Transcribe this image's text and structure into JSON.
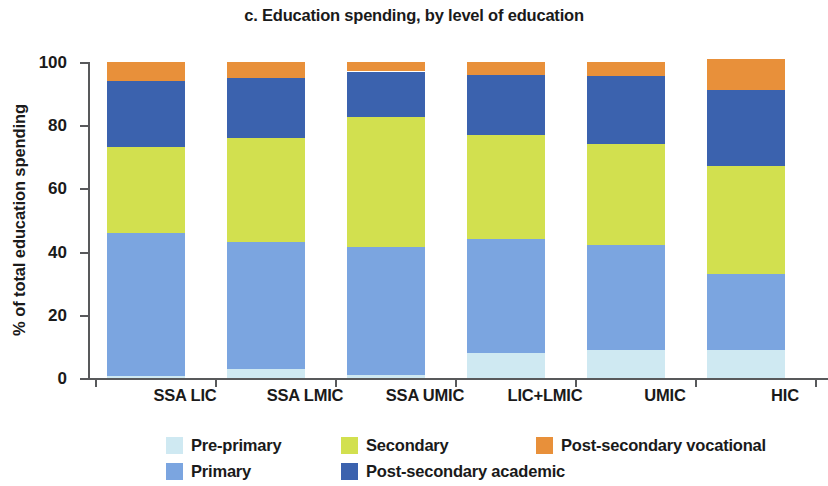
{
  "chart_data": {
    "type": "bar",
    "subtype": "stacked-100",
    "title": "c. Education spending, by level of education",
    "xlabel": "",
    "ylabel": "% of total education spending",
    "ylim": [
      0,
      100
    ],
    "yticks": [
      0,
      20,
      40,
      60,
      80,
      100
    ],
    "grid": false,
    "legend_position": "bottom",
    "categories": [
      "SSA LIC",
      "SSA LMIC",
      "SSA UMIC",
      "LIC+LMIC",
      "UMIC",
      "HIC"
    ],
    "series": [
      {
        "name": "Pre-primary",
        "color": "#cfe9f2",
        "values": [
          0.5,
          3.0,
          1.0,
          8.0,
          9.0,
          9.0
        ]
      },
      {
        "name": "Primary",
        "color": "#7ba5e0",
        "values": [
          45.5,
          40.0,
          40.5,
          36.0,
          33.0,
          24.0
        ]
      },
      {
        "name": "Secondary",
        "color": "#d2e04f",
        "values": [
          27.0,
          33.0,
          41.0,
          33.0,
          32.0,
          34.0
        ]
      },
      {
        "name": "Post-secondary academic",
        "color": "#3b62ae",
        "values": [
          21.0,
          19.0,
          14.5,
          19.0,
          21.5,
          24.0
        ]
      },
      {
        "name": "Post-secondary vocational",
        "color": "#e8903a",
        "values": [
          6.0,
          5.0,
          3.0,
          4.0,
          4.5,
          10.0
        ]
      }
    ],
    "cumulative_tops": {
      "SSA LIC": [
        0.5,
        46.0,
        73.0,
        94.0,
        100.0
      ],
      "SSA LMIC": [
        3.0,
        43.0,
        76.0,
        95.0,
        100.0
      ],
      "SSA UMIC": [
        1.0,
        41.5,
        82.5,
        97.0,
        100.0
      ],
      "LIC+LMIC": [
        8.0,
        44.0,
        77.0,
        96.0,
        100.0
      ],
      "UMIC": [
        9.0,
        42.0,
        74.0,
        95.5,
        100.0
      ],
      "HIC": [
        9.0,
        33.0,
        67.0,
        91.0,
        101.0
      ]
    }
  },
  "legend": {
    "items": [
      {
        "label": "Pre-primary"
      },
      {
        "label": "Secondary"
      },
      {
        "label": "Post-secondary vocational"
      },
      {
        "label": "Primary"
      },
      {
        "label": "Post-secondary academic"
      }
    ]
  },
  "axis": {
    "y_tick_labels": [
      "100",
      "80",
      "60",
      "40",
      "20",
      "0"
    ]
  }
}
